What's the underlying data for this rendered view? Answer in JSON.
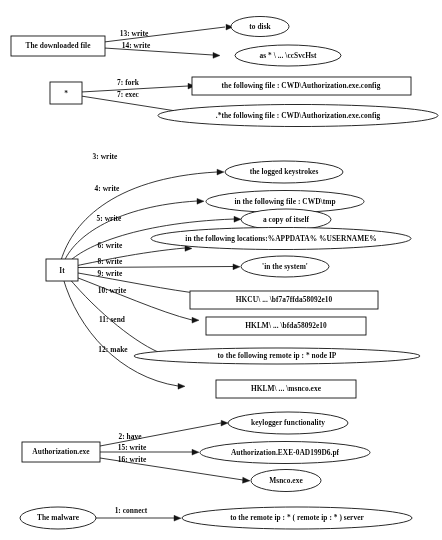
{
  "diagram": {
    "type": "behavior-graph",
    "title": "",
    "background_color": "#ffffff",
    "line_color": "#1a1a1f",
    "text_color": "#101014",
    "subjects": [
      {
        "id": "downloaded_file",
        "label": "The downloaded file",
        "shape": "box"
      },
      {
        "id": "star",
        "label": "*",
        "shape": "box"
      },
      {
        "id": "it",
        "label": "It",
        "shape": "box"
      },
      {
        "id": "authorization_exe",
        "label": "Authorization.exe",
        "shape": "box"
      },
      {
        "id": "the_malware",
        "label": "The malware",
        "shape": "ellipse"
      }
    ],
    "objects": [
      {
        "id": "to_disk",
        "label": "to disk",
        "shape": "ellipse"
      },
      {
        "id": "as_ccsvchst",
        "label": "as * \\ ... \\ccSvcHst",
        "shape": "ellipse"
      },
      {
        "id": "following_file_config",
        "label": "the following file : CWD\\Authorization.exe.config",
        "shape": "box"
      },
      {
        "id": "star_following_file_config",
        "label": ".*the following file : CWD\\Authorization.exe.config",
        "shape": "ellipse"
      },
      {
        "id": "logged_keystrokes",
        "label": "the logged keystrokes",
        "shape": "ellipse"
      },
      {
        "id": "following_file_cwd_tmp",
        "label": "in the following file : CWD\\tmp",
        "shape": "ellipse"
      },
      {
        "id": "copy_of_itself",
        "label": "a copy of itself",
        "shape": "ellipse"
      },
      {
        "id": "following_locations",
        "label": "in the following locations:%APPDATA% %USERNAME%",
        "shape": "ellipse"
      },
      {
        "id": "in_the_system",
        "label": "'in the system'",
        "shape": "ellipse"
      },
      {
        "id": "hkcu_key",
        "label": "HKCU\\ ... \\bf7a7ffda58092e10",
        "shape": "box"
      },
      {
        "id": "hklm_key",
        "label": "HKLM\\ ... \\bfda58092e10",
        "shape": "box"
      },
      {
        "id": "remote_ip_node",
        "label": "to the following remote ip : * node IP",
        "shape": "ellipse"
      },
      {
        "id": "hklm_msnco",
        "label": "HKLM\\ ... \\msnco.exe",
        "shape": "box"
      },
      {
        "id": "keylogger_functionality",
        "label": "keylogger functionality",
        "shape": "ellipse"
      },
      {
        "id": "authorization_pf",
        "label": "Authorization.EXE-0AD199D6.pf",
        "shape": "ellipse"
      },
      {
        "id": "msnco_exe",
        "label": "Msnco.exe",
        "shape": "ellipse"
      },
      {
        "id": "remote_ip_server",
        "label": "to the remote ip : * ( remote ip : * ) server",
        "shape": "ellipse"
      }
    ],
    "edges": [
      {
        "id": "e13",
        "label": "13: write",
        "from": "downloaded_file",
        "to": "to_disk"
      },
      {
        "id": "e14",
        "label": "14: write",
        "from": "downloaded_file",
        "to": "as_ccsvchst"
      },
      {
        "id": "e7fork",
        "label": "7: fork",
        "from": "star",
        "to": "following_file_config"
      },
      {
        "id": "e7exec",
        "label": "7: exec",
        "from": "star",
        "to": "star_following_file_config"
      },
      {
        "id": "e3",
        "label": "3: write",
        "from": "it",
        "to": "logged_keystrokes"
      },
      {
        "id": "e4",
        "label": "4: write",
        "from": "it",
        "to": "following_file_cwd_tmp"
      },
      {
        "id": "e5",
        "label": "5: write",
        "from": "it",
        "to": "copy_of_itself"
      },
      {
        "id": "e6",
        "label": "6: write",
        "from": "it",
        "to": "following_locations"
      },
      {
        "id": "e8",
        "label": "8: write",
        "from": "it",
        "to": "in_the_system"
      },
      {
        "id": "e9",
        "label": "9: write",
        "from": "it",
        "to": "hkcu_key"
      },
      {
        "id": "e10",
        "label": "10: write",
        "from": "it",
        "to": "hklm_key"
      },
      {
        "id": "e11",
        "label": "11: send",
        "from": "it",
        "to": "remote_ip_node"
      },
      {
        "id": "e12",
        "label": "12: make",
        "from": "it",
        "to": "hklm_msnco"
      },
      {
        "id": "e2",
        "label": "2: have",
        "from": "authorization_exe",
        "to": "keylogger_functionality"
      },
      {
        "id": "e15",
        "label": "15: write",
        "from": "authorization_exe",
        "to": "authorization_pf"
      },
      {
        "id": "e16",
        "label": "16: write",
        "from": "authorization_exe",
        "to": "msnco_exe"
      },
      {
        "id": "e1",
        "label": "1: connect",
        "from": "the_malware",
        "to": "remote_ip_server"
      }
    ]
  }
}
